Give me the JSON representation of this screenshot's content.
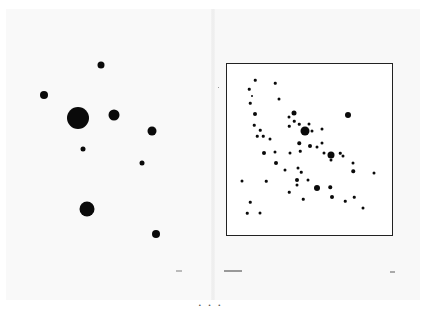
{
  "spread": {
    "left_page": {
      "page_number": "",
      "dots": [
        {
          "x": 101,
          "y": 65,
          "d": 7
        },
        {
          "x": 44,
          "y": 95,
          "d": 8
        },
        {
          "x": 78,
          "y": 118,
          "d": 22
        },
        {
          "x": 114,
          "y": 115,
          "d": 11
        },
        {
          "x": 152,
          "y": 131,
          "d": 9
        },
        {
          "x": 83,
          "y": 149,
          "d": 5
        },
        {
          "x": 142,
          "y": 163,
          "d": 5
        },
        {
          "x": 87,
          "y": 209,
          "d": 15
        },
        {
          "x": 156,
          "y": 234,
          "d": 8
        }
      ]
    },
    "right_page": {
      "running_head": "",
      "page_number": "",
      "frame": {
        "left": 226,
        "top": 63,
        "right": 393,
        "bottom": 236
      },
      "dots": [
        {
          "x": 255,
          "y": 80,
          "d": 2.5
        },
        {
          "x": 275,
          "y": 83,
          "d": 2.5
        },
        {
          "x": 249,
          "y": 89,
          "d": 2.5
        },
        {
          "x": 252,
          "y": 96,
          "d": 2
        },
        {
          "x": 279,
          "y": 99,
          "d": 3
        },
        {
          "x": 250,
          "y": 103,
          "d": 2.5
        },
        {
          "x": 255,
          "y": 114,
          "d": 4
        },
        {
          "x": 294,
          "y": 113,
          "d": 5
        },
        {
          "x": 348,
          "y": 115,
          "d": 6
        },
        {
          "x": 289,
          "y": 117,
          "d": 3
        },
        {
          "x": 254,
          "y": 125,
          "d": 2.5
        },
        {
          "x": 294,
          "y": 121,
          "d": 2.5
        },
        {
          "x": 299,
          "y": 124,
          "d": 2.5
        },
        {
          "x": 309,
          "y": 124,
          "d": 3
        },
        {
          "x": 289,
          "y": 126,
          "d": 2.5
        },
        {
          "x": 305,
          "y": 131,
          "d": 9
        },
        {
          "x": 312,
          "y": 131,
          "d": 3
        },
        {
          "x": 322,
          "y": 129,
          "d": 3
        },
        {
          "x": 260,
          "y": 130,
          "d": 2.5
        },
        {
          "x": 257,
          "y": 136,
          "d": 2.5
        },
        {
          "x": 263,
          "y": 136,
          "d": 2.5
        },
        {
          "x": 270,
          "y": 139,
          "d": 3
        },
        {
          "x": 299,
          "y": 143,
          "d": 3.5
        },
        {
          "x": 310,
          "y": 146,
          "d": 4
        },
        {
          "x": 317,
          "y": 147,
          "d": 3
        },
        {
          "x": 322,
          "y": 143,
          "d": 3
        },
        {
          "x": 264,
          "y": 153,
          "d": 4
        },
        {
          "x": 275,
          "y": 152,
          "d": 3
        },
        {
          "x": 290,
          "y": 153,
          "d": 3
        },
        {
          "x": 300,
          "y": 151,
          "d": 2.5
        },
        {
          "x": 324,
          "y": 153,
          "d": 3
        },
        {
          "x": 331,
          "y": 155,
          "d": 7
        },
        {
          "x": 340,
          "y": 153,
          "d": 2.5
        },
        {
          "x": 343,
          "y": 156,
          "d": 3
        },
        {
          "x": 331,
          "y": 160,
          "d": 3
        },
        {
          "x": 276,
          "y": 163,
          "d": 4
        },
        {
          "x": 353,
          "y": 163,
          "d": 3
        },
        {
          "x": 298,
          "y": 168,
          "d": 3
        },
        {
          "x": 353,
          "y": 171,
          "d": 3.5
        },
        {
          "x": 285,
          "y": 170,
          "d": 3
        },
        {
          "x": 301,
          "y": 172,
          "d": 2.5
        },
        {
          "x": 374,
          "y": 173,
          "d": 3
        },
        {
          "x": 242,
          "y": 181,
          "d": 3
        },
        {
          "x": 266,
          "y": 181,
          "d": 2.5
        },
        {
          "x": 297,
          "y": 180,
          "d": 4
        },
        {
          "x": 308,
          "y": 180,
          "d": 3
        },
        {
          "x": 297,
          "y": 185,
          "d": 3
        },
        {
          "x": 289,
          "y": 192,
          "d": 2.5
        },
        {
          "x": 317,
          "y": 188,
          "d": 6
        },
        {
          "x": 330,
          "y": 187,
          "d": 3.5
        },
        {
          "x": 303,
          "y": 199,
          "d": 2.5
        },
        {
          "x": 332,
          "y": 197,
          "d": 4
        },
        {
          "x": 345,
          "y": 201,
          "d": 2.5
        },
        {
          "x": 354,
          "y": 197,
          "d": 2.5
        },
        {
          "x": 363,
          "y": 208,
          "d": 3
        },
        {
          "x": 250,
          "y": 202,
          "d": 2.5
        },
        {
          "x": 247,
          "y": 213,
          "d": 2.5
        },
        {
          "x": 260,
          "y": 213,
          "d": 3
        }
      ]
    }
  },
  "caption": "• • •"
}
